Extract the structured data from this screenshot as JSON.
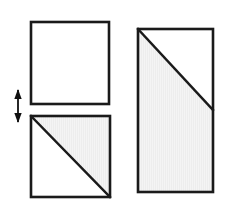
{
  "figure": {
    "title": "Paper folding diagram: two squares and a tall rectangle",
    "canvas": {
      "width": 233,
      "height": 213,
      "background": "#ffffff"
    },
    "style": {
      "stroke_color": "#1a1a1a",
      "stroke_width": 2.6,
      "diagonal_stroke_width": 2.4,
      "shade_fill": "#ededed",
      "shade_texture_color": "#f7f7f7",
      "arrow_color": "#111111"
    },
    "shapes": [
      {
        "id": "top-left-square",
        "name": "empty-square",
        "label": "Top left square (unshaded)",
        "type": "square",
        "x": 31,
        "y": 22,
        "width": 78,
        "height": 82,
        "shaded": false,
        "shaded_region": "none",
        "diagonal": "none"
      },
      {
        "id": "bottom-left-square",
        "name": "half-shaded-square",
        "label": "Bottom left square with diagonal, upper-right half shaded",
        "type": "square",
        "x": 31,
        "y": 116,
        "width": 79,
        "height": 81,
        "shaded": true,
        "shaded_region": "upper-right-triangle",
        "diagonal": "top-left-to-bottom-right"
      },
      {
        "id": "right-rectangle",
        "name": "tall-shaded-rectangle",
        "label": "Tall right rectangle with diagonal from top-left to right edge midpoint, lower-left region shaded",
        "type": "rectangle",
        "x": 138,
        "y": 29,
        "width": 75,
        "height": 163,
        "shaded": true,
        "shaded_region": "lower-left-polygon",
        "diagonal": "top-left-to-right-edge-midpoint",
        "diagonal_end_y": 110
      }
    ],
    "arrow": {
      "id": "fold-arrow",
      "name": "double-headed-vertical-arrow",
      "label": "Double headed vertical arrow indicating fold direction",
      "x": 18,
      "y_top": 90,
      "y_bottom": 122,
      "heads": "both",
      "orientation": "vertical"
    }
  }
}
